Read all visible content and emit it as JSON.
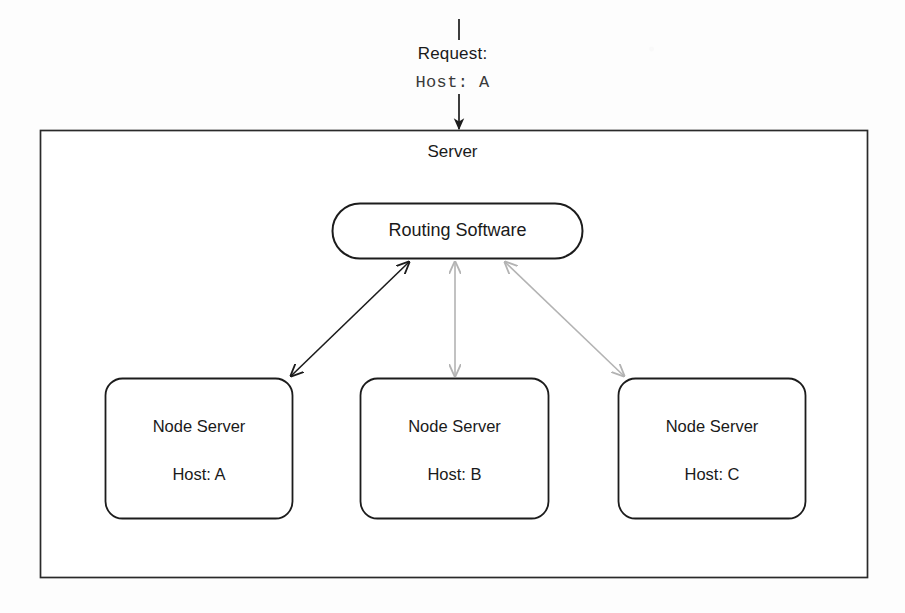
{
  "diagram": {
    "colors": {
      "stroke_dark": "#1c1c1c",
      "stroke_grey": "#b3b3b3",
      "background": "#fdfdfd",
      "text": "#1a1a1a"
    },
    "incoming": {
      "request_label": "Request:",
      "request_host": "Host: A",
      "arrow": "down-arrow"
    },
    "server": {
      "label": "Server"
    },
    "router": {
      "label": "Routing Software"
    },
    "nodes": [
      {
        "title": "Node Server",
        "host": "Host: A",
        "link_color": "#1c1c1c",
        "link_state": "active"
      },
      {
        "title": "Node Server",
        "host": "Host: B",
        "link_color": "#b3b3b3",
        "link_state": "idle"
      },
      {
        "title": "Node Server",
        "host": "Host: C",
        "link_color": "#b3b3b3",
        "link_state": "idle"
      }
    ]
  }
}
